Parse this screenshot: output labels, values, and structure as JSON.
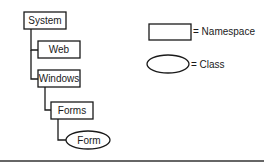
{
  "diagram": {
    "type": "namespace-hierarchy",
    "nodes": [
      {
        "id": "system",
        "label": "System",
        "kind": "namespace",
        "parent": null
      },
      {
        "id": "web",
        "label": "Web",
        "kind": "namespace",
        "parent": "system"
      },
      {
        "id": "windows",
        "label": "Windows",
        "kind": "namespace",
        "parent": "system"
      },
      {
        "id": "forms",
        "label": "Forms",
        "kind": "namespace",
        "parent": "windows"
      },
      {
        "id": "form",
        "label": "Form",
        "kind": "class",
        "parent": "forms"
      }
    ],
    "legend": {
      "namespace_label": "= Namespace",
      "class_label": "= Class"
    },
    "colors": {
      "stroke": "#1a1a1a",
      "fill": "#ffffff",
      "rule": "#333333"
    }
  }
}
